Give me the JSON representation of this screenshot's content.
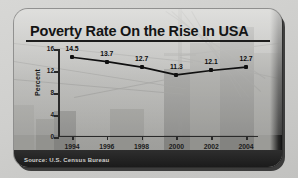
{
  "graphic": {
    "title": "Poverty Rate On the Rise In USA",
    "source": "Source: U.S. Census Bureau"
  },
  "chart_data": {
    "type": "line",
    "title": "Poverty Rate On the Rise In USA",
    "xlabel": "",
    "ylabel": "Percent",
    "categories": [
      "1994",
      "1996",
      "1998",
      "2000",
      "2002",
      "2004"
    ],
    "values": [
      14.5,
      13.7,
      12.7,
      11.3,
      12.1,
      12.7
    ],
    "point_labels": [
      "14.5",
      "13.7",
      "12.7",
      "11.3",
      "12.1",
      "12.7"
    ],
    "ylim": [
      0,
      16
    ],
    "yticks": [
      "0",
      "4",
      "8",
      "12",
      "16"
    ],
    "ytick_values": [
      0,
      4,
      8,
      12,
      16
    ],
    "grid": false,
    "legend": "none",
    "line_color": "#101010",
    "marker_color": "#101010",
    "annotation": "Poverty rate percentage of U.S. population, 1994-2004"
  }
}
